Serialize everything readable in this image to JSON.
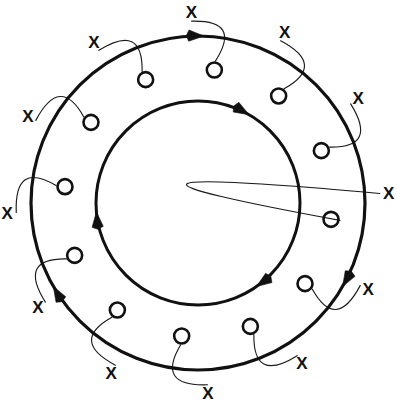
{
  "figure": {
    "background_color": "#ffffff",
    "stroke_color": "#111111",
    "thin_stroke_color": "#1a1a1a",
    "width": 397,
    "height": 419
  },
  "geometry": {
    "center_x": 198,
    "center_y": 203,
    "outer_ring_radius": 167,
    "inner_ring_radius": 102,
    "outer_ring_stroke_width": 3.2,
    "inner_ring_stroke_width": 3.0,
    "x_marker_radius": 191,
    "o_marker_radius": 134,
    "o_marker_circle_radius": 7.5
  },
  "chart_data": {
    "type": "diagram",
    "rings": [
      {
        "name": "outer-ring",
        "radius": 167,
        "direction": "clockwise",
        "stroke_width": 3.2,
        "arrow_angles_deg": [
          272,
          30,
          150
        ]
      },
      {
        "name": "inner-ring",
        "radius": 102,
        "direction": "clockwise",
        "stroke_width": 3.0,
        "arrow_angles_deg": [
          300,
          55,
          175
        ]
      }
    ],
    "x_markers": {
      "label": "X",
      "count": 12,
      "radius": 191,
      "angles_deg": [
        268,
        297,
        327,
        357,
        27,
        57,
        87,
        117,
        147,
        177,
        207,
        237
      ]
    },
    "o_markers": {
      "label": "O",
      "count": 12,
      "radius": 134,
      "angles_deg": [
        277,
        307,
        337,
        7,
        37,
        67,
        97,
        127,
        157,
        187,
        217,
        247
      ]
    },
    "pairs": [
      {
        "x_angle_deg": 268,
        "o_angle_deg": 277,
        "label_x": "X",
        "label_o": "O"
      },
      {
        "x_angle_deg": 297,
        "o_angle_deg": 307,
        "label_x": "X",
        "label_o": "O"
      },
      {
        "x_angle_deg": 327,
        "o_angle_deg": 337,
        "label_x": "X",
        "label_o": "O"
      },
      {
        "x_angle_deg": 357,
        "o_angle_deg": 7,
        "label_x": "X",
        "label_o": "O"
      },
      {
        "x_angle_deg": 27,
        "o_angle_deg": 37,
        "label_x": "X",
        "label_o": "O"
      },
      {
        "x_angle_deg": 57,
        "o_angle_deg": 67,
        "label_x": "X",
        "label_o": "O"
      },
      {
        "x_angle_deg": 87,
        "o_angle_deg": 97,
        "label_x": "X",
        "label_o": "O"
      },
      {
        "x_angle_deg": 117,
        "o_angle_deg": 127,
        "label_x": "X",
        "label_o": "O"
      },
      {
        "x_angle_deg": 147,
        "o_angle_deg": 157,
        "label_x": "X",
        "label_o": "O"
      },
      {
        "x_angle_deg": 177,
        "o_angle_deg": 187,
        "label_x": "X",
        "label_o": "O"
      },
      {
        "x_angle_deg": 207,
        "o_angle_deg": 217,
        "label_x": "X",
        "label_o": "O"
      },
      {
        "x_angle_deg": 237,
        "o_angle_deg": 247,
        "label_x": "X",
        "label_o": "O"
      }
    ],
    "legend": [],
    "annotations": []
  },
  "labels": {
    "x_symbol": "X",
    "o_symbol": "O"
  }
}
